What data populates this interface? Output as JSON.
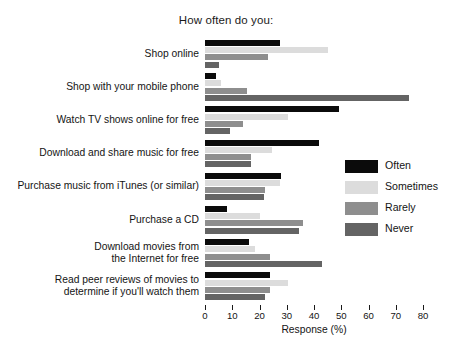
{
  "chart_data": {
    "type": "bar",
    "orientation": "horizontal",
    "title": "How often do you:",
    "xlabel": "Response (%)",
    "ylabel": "",
    "xlim": [
      0,
      80
    ],
    "xticks": [
      0,
      10,
      20,
      30,
      40,
      50,
      60,
      70,
      80
    ],
    "grid": false,
    "legend_position": "right",
    "categories": [
      "Shop online",
      "Shop with your mobile phone",
      "Watch TV shows online for free",
      "Download and share music for free",
      "Purchase music from iTunes (or similar)",
      "Purchase a CD",
      "Download movies from\nthe Internet for free",
      "Read peer reviews of movies to\ndetermine if you'll watch them"
    ],
    "series": [
      {
        "name": "Often",
        "color": "#0b0b0b",
        "values": [
          27.5,
          4,
          49,
          42,
          28,
          8,
          16,
          24
        ]
      },
      {
        "name": "Sometimes",
        "color": "#dcdcdc",
        "values": [
          45,
          6,
          30.5,
          24.5,
          27.5,
          20,
          18.5,
          30.5
        ]
      },
      {
        "name": "Rarely",
        "color": "#8e8e8e",
        "values": [
          23,
          15.5,
          14,
          17,
          22,
          36,
          24,
          24
        ]
      },
      {
        "name": "Never",
        "color": "#646464",
        "values": [
          5,
          75,
          9,
          17,
          21.5,
          34.5,
          43,
          22
        ]
      }
    ]
  }
}
